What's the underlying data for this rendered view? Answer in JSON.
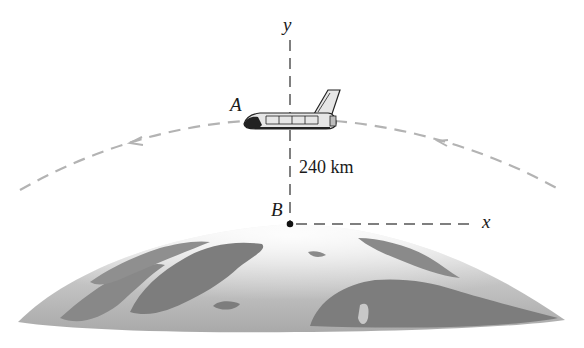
{
  "diagram": {
    "labels": {
      "point_a": "A",
      "point_b": "B",
      "axis_x": "x",
      "axis_y": "y",
      "altitude": "240 km"
    },
    "colors": {
      "dashed_line": "#b3b3b3",
      "axis_dash": "#555555",
      "earth_dark": "#7d7d7d",
      "earth_light": "#d8d8d8",
      "shuttle_body": "#e6e6e6",
      "shuttle_outline": "#222222"
    }
  }
}
